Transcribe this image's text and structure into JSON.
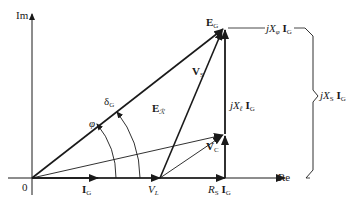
{
  "diagram": {
    "type": "phasor-diagram",
    "axes": {
      "imaginary_label": "Im",
      "real_label": "Re",
      "origin_label": "0"
    },
    "phasors": {
      "current": {
        "main": "I",
        "sub": "G"
      },
      "generator_emf": {
        "main": "E",
        "sub": "G"
      },
      "air_gap_emf": {
        "main": "E",
        "sub": "ℛ"
      },
      "stator_voltage": {
        "main": "V",
        "sub": "S"
      },
      "capacitor_voltage": {
        "main": "V",
        "sub": "C"
      },
      "load_voltage": {
        "main": "V",
        "sub": "L"
      }
    },
    "drops": {
      "resistive": {
        "prefix": "R",
        "prefix_sub": "S",
        "main": "I",
        "sub": "G"
      },
      "leakage_reactive": {
        "prefix": "jX",
        "prefix_sub": "ℓ",
        "main": "I",
        "sub": "G"
      },
      "magnetizing_reactive": {
        "prefix": "jX",
        "prefix_sub": "φ",
        "main": "I",
        "sub": "G"
      },
      "synchronous_reactive": {
        "prefix": "jX",
        "prefix_sub": "S",
        "main": "I",
        "sub": "G"
      }
    },
    "angles": {
      "power_angle": {
        "main": "δ",
        "sub": "G"
      },
      "phase_angle": "φ"
    },
    "colors": {
      "line": "#1a1a1a",
      "background": "#ffffff"
    }
  }
}
